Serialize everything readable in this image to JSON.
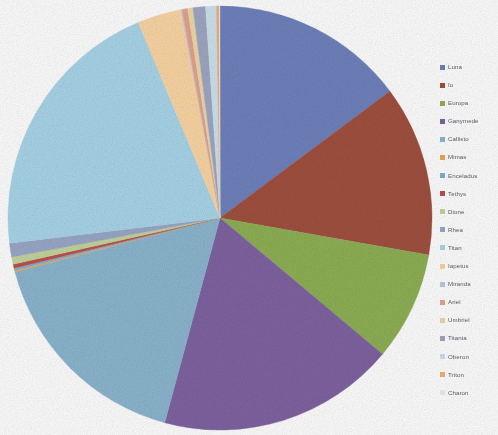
{
  "chart_data": {
    "type": "pie",
    "title": "",
    "subtitle": "",
    "xlabel": "",
    "ylabel": "",
    "grid": false,
    "legend_position": "right",
    "start_angle_deg": 0,
    "direction": "clockwise",
    "categories": [
      "Luna",
      "Io",
      "Europa",
      "Ganymede",
      "Callisto",
      "Mimas",
      "Enceladus",
      "Tethys",
      "Dione",
      "Rhea",
      "Titan",
      "Iapetus",
      "Miranda",
      "Ariel",
      "Umbriel",
      "Titania",
      "Oberon",
      "Triton",
      "Charon"
    ],
    "values": [
      14.8,
      13.0,
      8.3,
      18.1,
      16.7,
      0.12,
      0.18,
      0.3,
      0.55,
      1.05,
      20.6,
      3.35,
      0.09,
      0.42,
      0.4,
      0.95,
      0.82,
      0.22,
      0.05
    ],
    "unit": "percent",
    "colors": [
      "#6f82bd",
      "#a1503f",
      "#8eb055",
      "#7f63a1",
      "#8cb6cf",
      "#e8a860",
      "#7fb3d5",
      "#c0504d",
      "#c3d69b",
      "#9aa8c8",
      "#a9d5e9",
      "#fbd6a4",
      "#b8cde0",
      "#e5a38e",
      "#efd9a8",
      "#9fa8c4",
      "#cde3ef",
      "#f2b27a",
      "#eaeef2"
    ],
    "labels_visible": false,
    "percent_labels": false
  },
  "legend": {
    "items": [
      {
        "label": "Luna",
        "color": "#6f82bd"
      },
      {
        "label": "Io",
        "color": "#a1503f"
      },
      {
        "label": "Europa",
        "color": "#8eb055"
      },
      {
        "label": "Ganymede",
        "color": "#7f63a1"
      },
      {
        "label": "Callisto",
        "color": "#8cb6cf"
      },
      {
        "label": "Mimas",
        "color": "#e8a860"
      },
      {
        "label": "Enceladus",
        "color": "#7fb3d5"
      },
      {
        "label": "Tethys",
        "color": "#c0504d"
      },
      {
        "label": "Dione",
        "color": "#c3d69b"
      },
      {
        "label": "Rhea",
        "color": "#9aa8c8"
      },
      {
        "label": "Titan",
        "color": "#a9d5e9"
      },
      {
        "label": "Iapetus",
        "color": "#fbd6a4"
      },
      {
        "label": "Miranda",
        "color": "#b8cde0"
      },
      {
        "label": "Ariel",
        "color": "#e5a38e"
      },
      {
        "label": "Umbriel",
        "color": "#efd9a8"
      },
      {
        "label": "Titania",
        "color": "#9fa8c4"
      },
      {
        "label": "Oberon",
        "color": "#cde3ef"
      },
      {
        "label": "Triton",
        "color": "#f2b27a"
      },
      {
        "label": "Charon",
        "color": "#eaeef2"
      }
    ]
  },
  "pie": {
    "center_x": 220,
    "center_y": 218,
    "radius": 212
  },
  "canvas": {
    "background": "#ffffff",
    "width": 498,
    "height": 435
  }
}
